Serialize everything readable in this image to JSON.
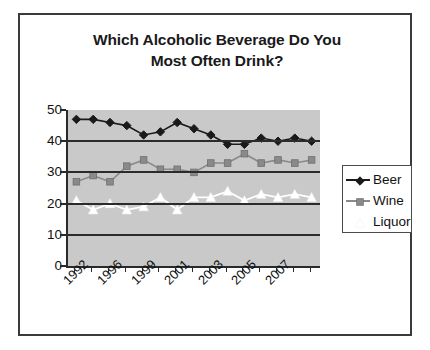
{
  "figure": {
    "title_line1": "Which Alcoholic Beverage Do You",
    "title_line2": "Most Often Drink?",
    "plot_background": "#c9c9c9",
    "border_color": "#3a3a3a"
  },
  "legend": {
    "position": "right",
    "entries": [
      {
        "label": "Beer",
        "color": "#1a1a1a",
        "marker": "diamond-marker"
      },
      {
        "label": "Wine",
        "color": "#8a8a8a",
        "marker": "square-marker"
      },
      {
        "label": "Liquor",
        "color": "#ffffff",
        "marker": "triangle-marker"
      }
    ]
  },
  "chart_data": {
    "type": "line",
    "title": "Which Alcoholic Beverage Do You Most Often Drink?",
    "xlabel": "",
    "ylabel": "",
    "ylim": [
      0,
      50
    ],
    "y_ticks": [
      0,
      10,
      20,
      30,
      40,
      50
    ],
    "grid": true,
    "legend_position": "right",
    "x": [
      1992,
      1994,
      1996,
      1997,
      1999,
      2000,
      2001,
      2002,
      2003,
      2004,
      2005,
      2006,
      2007,
      2008,
      2009
    ],
    "x_tick_labels": [
      "1992",
      "1996",
      "1999",
      "2001",
      "2003",
      "2005",
      "2007"
    ],
    "x_tick_label_indices": [
      0,
      2,
      4,
      6,
      8,
      10,
      12
    ],
    "series": [
      {
        "name": "Beer",
        "color": "#1a1a1a",
        "marker": "diamond",
        "values": [
          47,
          47,
          46,
          45,
          42,
          43,
          46,
          44,
          42,
          39,
          39,
          41,
          40,
          41,
          40
        ]
      },
      {
        "name": "Wine",
        "color": "#8a8a8a",
        "marker": "square",
        "values": [
          27,
          29,
          27,
          32,
          34,
          31,
          31,
          30,
          33,
          33,
          36,
          33,
          34,
          33,
          34
        ]
      },
      {
        "name": "Liquor",
        "color": "#ffffff",
        "marker": "triangle",
        "values": [
          21,
          18,
          20,
          18,
          19,
          22,
          18,
          22,
          22,
          24,
          21,
          23,
          22,
          23,
          22
        ]
      }
    ]
  }
}
